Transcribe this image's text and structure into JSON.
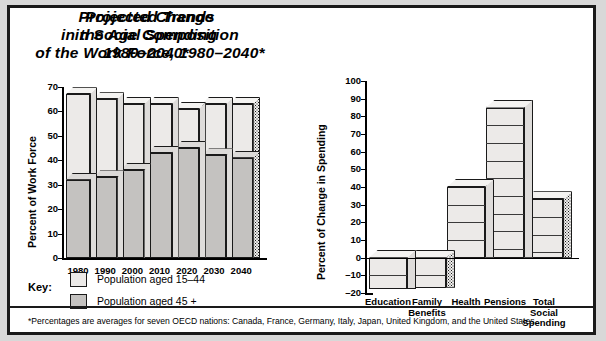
{
  "figure": {
    "footnote": "*Percentages are averages for seven OECD nations: Canada, France, Germany, Italy, Japan, United Kingdom, and the United States.",
    "frame_color": "#1a1a1a",
    "background": "#ffffff",
    "page_background": "#d8d8d8"
  },
  "key": {
    "label": "Key:",
    "items": [
      {
        "name": "Population aged 15–44",
        "color": "#eceae8"
      },
      {
        "name": "Population aged 45 +",
        "color": "#c4c2c0"
      }
    ]
  },
  "chart_data": [
    {
      "id": "work-force",
      "type": "bar",
      "stacked": true,
      "title": "Projected Trends\nin the Age Composition\nof the Work Force, 1980–2040*",
      "title_lines": [
        "Projected Trends",
        "in the Age Composition",
        "of the Work Force, 1980–2040*"
      ],
      "xlabel": "",
      "ylabel": "Percent of Work Force",
      "ylim": [
        0,
        70
      ],
      "yticks": [
        0,
        10,
        20,
        30,
        40,
        50,
        60,
        70
      ],
      "ytick_labels": [
        "0",
        "10",
        "20",
        "30",
        "40",
        "50",
        "60",
        "70"
      ],
      "grid": false,
      "legend_position": "below-left",
      "categories": [
        "1980",
        "1990",
        "2000",
        "2010",
        "2020",
        "2030",
        "2040"
      ],
      "series": [
        {
          "name": "Population aged 45 +",
          "color": "#c4c2c0",
          "values": [
            32,
            33,
            36,
            43,
            45,
            42,
            41
          ]
        },
        {
          "name": "Population aged 15–44",
          "color": "#eceae8",
          "values": [
            35,
            32,
            27,
            20,
            16,
            21,
            22
          ]
        }
      ],
      "totals": [
        67,
        65,
        63,
        63,
        61,
        63,
        63
      ]
    },
    {
      "id": "social-spending",
      "type": "bar",
      "stacked": false,
      "title": "Projected Change\nin Social Spending\n1980–2040*",
      "title_lines": [
        "Projected Change",
        "in Social Spending",
        "1980–2040*"
      ],
      "xlabel": "",
      "ylabel": "Percent of Change in Spending",
      "ylim": [
        -20,
        100
      ],
      "yticks": [
        -20,
        -10,
        0,
        10,
        20,
        30,
        40,
        50,
        60,
        70,
        80,
        90,
        100
      ],
      "ytick_labels": [
        "–20",
        "–10",
        "0",
        "10",
        "20",
        "30",
        "40",
        "50",
        "60",
        "70",
        "80",
        "90",
        "100"
      ],
      "grid": false,
      "categories": [
        "Education",
        "Family Benefits",
        "Health",
        "Pensions",
        "Total Social Spending"
      ],
      "category_lines": [
        [
          "Education"
        ],
        [
          "Family",
          "Benefits"
        ],
        [
          "Health"
        ],
        [
          "Pensions"
        ],
        [
          "Total",
          "Social",
          "Spending"
        ]
      ],
      "values": [
        -18,
        -17,
        40,
        85,
        33
      ],
      "bar_color": "#eceae8"
    }
  ]
}
